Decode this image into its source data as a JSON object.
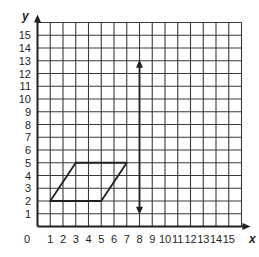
{
  "chart_data": {
    "type": "diagram",
    "title": "",
    "xlabel": "x",
    "ylabel": "y",
    "origin_label": "0",
    "xlim": [
      0,
      16
    ],
    "ylim": [
      0,
      16
    ],
    "grid": true,
    "x_ticks": [
      "1",
      "2",
      "3",
      "4",
      "5",
      "6",
      "7",
      "8",
      "9",
      "10",
      "11",
      "12",
      "13",
      "14",
      "15"
    ],
    "y_ticks": [
      "1",
      "2",
      "3",
      "4",
      "5",
      "6",
      "7",
      "8",
      "9",
      "10",
      "11",
      "12",
      "13",
      "14",
      "15"
    ],
    "shapes": [
      {
        "name": "parallelogram",
        "vertices": [
          [
            1,
            2
          ],
          [
            5,
            2
          ],
          [
            7,
            5
          ],
          [
            3,
            5
          ]
        ]
      }
    ],
    "lines": [
      {
        "name": "line-of-reflection",
        "type": "double-arrow",
        "from": [
          8,
          1
        ],
        "to": [
          8,
          13
        ]
      }
    ]
  },
  "colors": {
    "grid": "#3a3a3a",
    "ink": "#231f20",
    "background": "#ffffff"
  }
}
